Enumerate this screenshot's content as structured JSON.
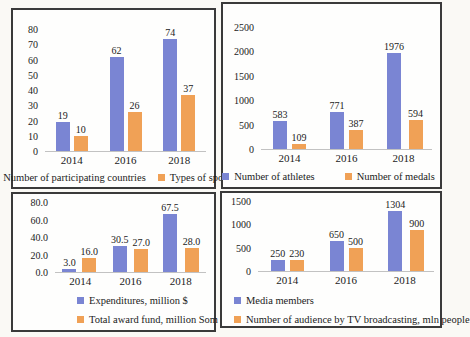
{
  "page": {
    "background": "#faf9f5"
  },
  "colors": {
    "series_blue": "#7a85d3",
    "series_orange": "#f0a156",
    "axis_line": "#c2c2c2",
    "panel_border": "#3a3a3a",
    "text": "#1b1b1b"
  },
  "chart_data": [
    {
      "type": "bar",
      "title": "",
      "xlabel": "",
      "ylabel": "",
      "categories": [
        "2014",
        "2016",
        "2018"
      ],
      "series": [
        {
          "name": "Number of participating countries",
          "color": "#7a85d3",
          "values": [
            19,
            62,
            74
          ],
          "labels": [
            "19",
            "62",
            "74"
          ]
        },
        {
          "name": "Types of sports",
          "color": "#f0a156",
          "values": [
            10,
            26,
            37
          ],
          "labels": [
            "10",
            "26",
            "37"
          ]
        }
      ],
      "ylim": [
        0,
        80
      ],
      "yticks": [
        "0",
        "10",
        "20",
        "30",
        "40",
        "50",
        "60",
        "70",
        "80"
      ],
      "grid": false,
      "legend_position": "bottom-center-row"
    },
    {
      "type": "bar",
      "title": "",
      "xlabel": "",
      "ylabel": "",
      "categories": [
        "2014",
        "2016",
        "2018"
      ],
      "series": [
        {
          "name": "Number of athletes",
          "color": "#7a85d3",
          "values": [
            583,
            771,
            1976
          ],
          "labels": [
            "583",
            "771",
            "1976"
          ]
        },
        {
          "name": "Number of medals",
          "color": "#f0a156",
          "values": [
            109,
            387,
            594
          ],
          "labels": [
            "109",
            "387",
            "594"
          ]
        }
      ],
      "ylim": [
        0,
        2500
      ],
      "yticks": [
        "0",
        "500",
        "1000",
        "1500",
        "2000",
        "2500"
      ],
      "grid": false,
      "legend_position": "bottom-center-row"
    },
    {
      "type": "bar",
      "title": "",
      "xlabel": "",
      "ylabel": "",
      "categories": [
        "2014",
        "2016",
        "2018"
      ],
      "series": [
        {
          "name": "Expenditures, million $",
          "color": "#7a85d3",
          "values": [
            3.0,
            30.5,
            67.5
          ],
          "labels": [
            "3.0",
            "30.5",
            "67.5"
          ]
        },
        {
          "name": "Total award fund, million Som",
          "color": "#f0a156",
          "values": [
            16.0,
            27.0,
            28.0
          ],
          "labels": [
            "16.0",
            "27.0",
            "28.0"
          ]
        }
      ],
      "ylim": [
        0,
        80
      ],
      "yticks": [
        "0.0",
        "20.0",
        "40.0",
        "60.0",
        "80.0"
      ],
      "grid": false,
      "legend_position": "bottom-left-column"
    },
    {
      "type": "bar",
      "title": "",
      "xlabel": "",
      "ylabel": "",
      "categories": [
        "2014",
        "2016",
        "2018"
      ],
      "series": [
        {
          "name": "Media members",
          "color": "#7a85d3",
          "values": [
            250,
            650,
            1304
          ],
          "labels": [
            "250",
            "650",
            "1304"
          ]
        },
        {
          "name": "Number of audience by TV broadcasting, mln  people",
          "color": "#f0a156",
          "values": [
            230,
            500,
            900
          ],
          "labels": [
            "230",
            "500",
            "900"
          ]
        }
      ],
      "ylim": [
        0,
        1500
      ],
      "yticks": [
        "0",
        "500",
        "1000",
        "1500"
      ],
      "grid": false,
      "legend_position": "bottom-left-column"
    }
  ]
}
